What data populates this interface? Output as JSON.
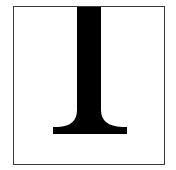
{
  "figure": {
    "glyph_color": "#000000",
    "border_color": "#3a3a3a",
    "background": "#ffffff"
  }
}
